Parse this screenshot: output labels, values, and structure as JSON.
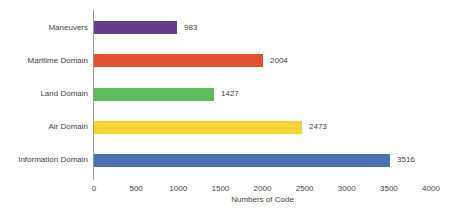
{
  "chart_data": {
    "type": "bar",
    "orientation": "horizontal",
    "categories": [
      "Maneuvers",
      "Maritime Domain",
      "Land Domain",
      "Air Domain",
      "Information Domain"
    ],
    "values": [
      983,
      2004,
      1427,
      2473,
      3516
    ],
    "value_labels": [
      "983",
      "2004",
      "1427",
      "2473",
      "3516"
    ],
    "bar_colors": [
      "#683C8C",
      "#E2502D",
      "#5CBB5A",
      "#F6D234",
      "#4A71B2"
    ],
    "title": "",
    "xlabel": "Numbers of Code",
    "ylabel": "",
    "xlim": [
      0,
      4000
    ],
    "xticks": [
      0,
      500,
      1000,
      1500,
      2000,
      2500,
      3000,
      3500,
      4000
    ],
    "grid": false,
    "legend": false,
    "axis_color": "#9B9B9B",
    "text_color": "#3F3F3F",
    "background_color": "#FFFFFF"
  }
}
